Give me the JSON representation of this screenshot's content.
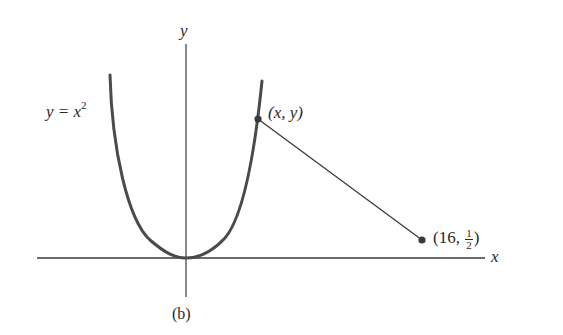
{
  "figure": {
    "caption": "(b)",
    "axes": {
      "x_label": "x",
      "y_label": "y"
    },
    "curve": {
      "equation_lhs": "y = x",
      "equation_exp": "2",
      "label": "y = x^2"
    },
    "point_on_curve": {
      "label": "(x, y)"
    },
    "fixed_point": {
      "label_prefix": "(16, ",
      "frac_num": "1",
      "frac_den": "2",
      "label_suffix": ")",
      "label": "(16, 1/2)"
    },
    "colors": {
      "curve": "#4a4a4a",
      "axis": "#3a3a3a",
      "text": "#2a2a2a"
    }
  }
}
